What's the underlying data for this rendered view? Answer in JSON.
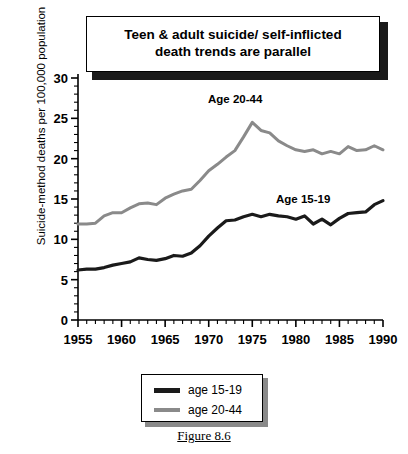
{
  "title": {
    "line1": "Teen & adult suicide/ self-inflicted",
    "line2": "death trends are parallel"
  },
  "caption": "Figure 8.6",
  "legend": {
    "items": [
      {
        "label": "age 15-19",
        "color": "#1a1a1a"
      },
      {
        "label": "age 20-44",
        "color": "#8a8a8a"
      }
    ]
  },
  "annotations": {
    "series_20_44": "Age 20-44",
    "series_15_19": "Age 15-19"
  },
  "chart_data": {
    "type": "line",
    "title": "Teen & adult suicide/ self-inflicted death trends are parallel",
    "xlabel": "",
    "ylabel": "Suicide-method deaths per 100,000 population",
    "xlim": [
      1955,
      1990
    ],
    "ylim": [
      0,
      30
    ],
    "yticks": [
      0,
      5,
      10,
      15,
      20,
      25,
      30
    ],
    "xticks": [
      1955,
      1960,
      1965,
      1970,
      1975,
      1980,
      1985,
      1990
    ],
    "xtick_minor_step": 1,
    "grid": false,
    "legend_position": "below-plot",
    "x": [
      1955,
      1956,
      1957,
      1958,
      1959,
      1960,
      1961,
      1962,
      1963,
      1964,
      1965,
      1966,
      1967,
      1968,
      1969,
      1970,
      1971,
      1972,
      1973,
      1974,
      1975,
      1976,
      1977,
      1978,
      1979,
      1980,
      1981,
      1982,
      1983,
      1984,
      1985,
      1986,
      1987,
      1988,
      1989,
      1990
    ],
    "series": [
      {
        "name": "age 15-19",
        "color": "#1a1a1a",
        "line_width": 3.2,
        "values": [
          6.2,
          6.3,
          6.3,
          6.5,
          6.8,
          7.0,
          7.2,
          7.7,
          7.5,
          7.4,
          7.6,
          8.0,
          7.9,
          8.3,
          9.2,
          10.4,
          11.4,
          12.3,
          12.4,
          12.8,
          13.1,
          12.8,
          13.1,
          12.9,
          12.8,
          12.5,
          12.9,
          11.9,
          12.5,
          11.8,
          12.6,
          13.2,
          13.3,
          13.4,
          14.3,
          14.8
        ]
      },
      {
        "name": "age 20-44",
        "color": "#8a8a8a",
        "line_width": 3.0,
        "values": [
          11.9,
          11.9,
          12.0,
          12.9,
          13.3,
          13.3,
          13.9,
          14.4,
          14.5,
          14.3,
          15.1,
          15.6,
          16.0,
          16.2,
          17.3,
          18.5,
          19.3,
          20.2,
          21.0,
          22.7,
          24.5,
          23.5,
          23.2,
          22.2,
          21.6,
          21.1,
          20.9,
          21.1,
          20.6,
          20.9,
          20.6,
          21.5,
          21.0,
          21.1,
          21.6,
          21.1
        ]
      }
    ]
  }
}
